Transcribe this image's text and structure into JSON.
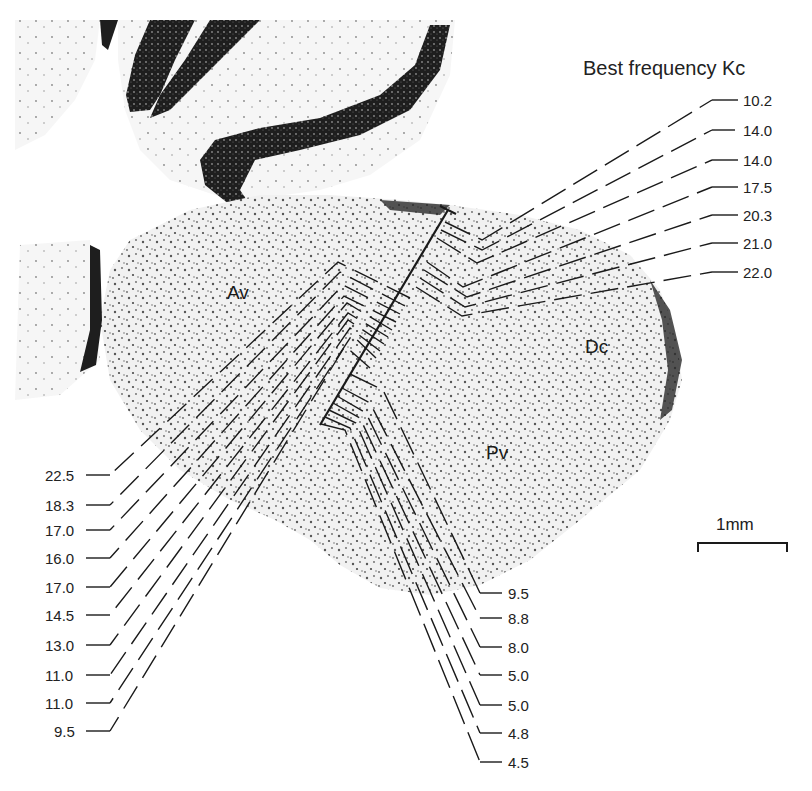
{
  "figure": {
    "title": "Best frequency Kc",
    "scale_bar": {
      "label": "1mm"
    },
    "regions": [
      {
        "id": "av",
        "label": "Av"
      },
      {
        "id": "dc",
        "label": "Dc"
      },
      {
        "id": "pv",
        "label": "Pv"
      }
    ],
    "upper_right_labels": [
      "10.2",
      "14.0",
      "14.0",
      "17.5",
      "20.3",
      "21.0",
      "22.0"
    ],
    "left_labels": [
      "22.5",
      "18.3",
      "17.0",
      "16.0",
      "17.0",
      "14.5",
      "13.0",
      "11.0",
      "11.0",
      "9.5"
    ],
    "lower_right_labels": [
      "9.5",
      "8.8",
      "8.0",
      "5.0",
      "5.0",
      "4.8",
      "4.5"
    ]
  },
  "colors": {
    "ink": "#222222",
    "tissue_light": "#eeeeee",
    "tissue_stain": "#2a2a2a"
  }
}
